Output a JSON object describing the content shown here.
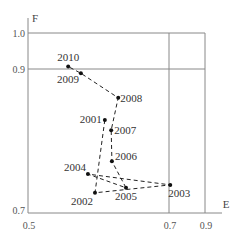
{
  "chart_data": {
    "type": "scatter",
    "title": "",
    "xlabel": "E",
    "ylabel": "F",
    "xlim": [
      0.5,
      0.9
    ],
    "ylim": [
      0.7,
      1.0
    ],
    "x_ticks": [
      "0.5",
      "0.7",
      "0.9"
    ],
    "y_ticks": [
      "0.7",
      "0.9",
      "1.0"
    ],
    "grid": false,
    "connected_path": true,
    "line_style": "dashed",
    "points": [
      {
        "label": "2001",
        "x": 0.609,
        "y": 0.829
      },
      {
        "label": "2002",
        "x": 0.595,
        "y": 0.728
      },
      {
        "label": "2003",
        "x": 0.707,
        "y": 0.739
      },
      {
        "label": "2004",
        "x": 0.585,
        "y": 0.754
      },
      {
        "label": "2005",
        "x": 0.639,
        "y": 0.735
      },
      {
        "label": "2006",
        "x": 0.619,
        "y": 0.772
      },
      {
        "label": "2007",
        "x": 0.618,
        "y": 0.815
      },
      {
        "label": "2008",
        "x": 0.628,
        "y": 0.86
      },
      {
        "label": "2009",
        "x": 0.575,
        "y": 0.894
      },
      {
        "label": "2010",
        "x": 0.557,
        "y": 0.907
      }
    ]
  },
  "colors": {
    "axis": "#888888",
    "line": "#222222",
    "point": "#111111"
  }
}
